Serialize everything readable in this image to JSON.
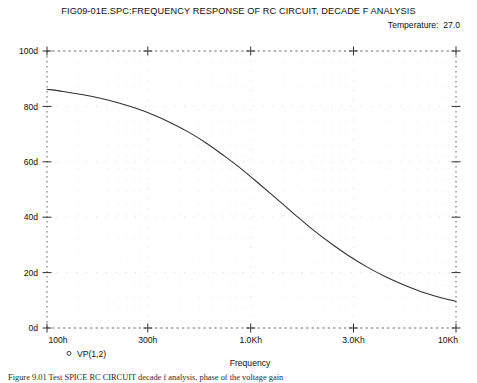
{
  "header": {
    "title": "FIG09-01E.SPC:FREQUENCY RESPONSE OF RC CIRCUIT, DECADE F ANALYSIS",
    "temperature": "Temperature:  27.0"
  },
  "caption": {
    "text": "Figure 9.01 Test SPICE RC CIRCUIT decade f analysis, phase of the voltage gain"
  },
  "chart_data": {
    "type": "line",
    "title": "FIG09-01E.SPC:FREQUENCY RESPONSE OF RC CIRCUIT, DECADE F ANALYSIS",
    "subtitle": "Temperature:  27.0",
    "xlabel": "Frequency",
    "ylabel": "",
    "xscale": "log",
    "xlim": [
      100,
      10000
    ],
    "ylim": [
      0,
      100
    ],
    "grid": true,
    "grid_style": "dotted",
    "legend_position": "below-left",
    "xticklabels": [
      "100h",
      "300h",
      "1.0Kh",
      "3.0Kh",
      "10Kh"
    ],
    "xtickvalues": [
      100,
      300,
      1000,
      3000,
      10000
    ],
    "yticklabels": [
      "0d",
      "20d",
      "40d",
      "60d",
      "80d",
      "100d"
    ],
    "ytickvalues": [
      0,
      20,
      40,
      60,
      80,
      100
    ],
    "series": [
      {
        "name": "VP(1,2)",
        "marker": "circle",
        "color": "#2f2f2f",
        "x": [
          100,
          120,
          150,
          180,
          220,
          270,
          330,
          400,
          490,
          600,
          730,
          900,
          1100,
          1350,
          1650,
          2000,
          2450,
          3000,
          3700,
          4500,
          5500,
          6700,
          8200,
          10000
        ],
        "y": [
          86.2,
          85.4,
          84.2,
          83.0,
          81.4,
          79.4,
          77.0,
          74.2,
          70.8,
          66.8,
          62.3,
          57.2,
          51.8,
          46.2,
          40.6,
          35.4,
          30.5,
          26.0,
          21.9,
          18.6,
          15.7,
          13.2,
          11.2,
          9.6
        ]
      }
    ]
  }
}
